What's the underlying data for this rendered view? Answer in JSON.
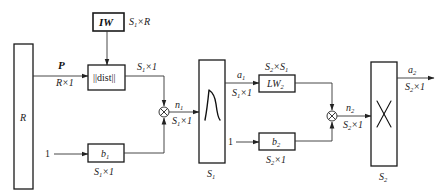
{
  "diagram": {
    "type": "block-diagram",
    "input_block": {
      "label": "R"
    },
    "input_signal": {
      "name": "P",
      "dims": "R×1"
    },
    "weight_block_1": {
      "label": "IW",
      "dims": "S1×R",
      "dims_main": "S",
      "dims_sub": "1",
      "dims_tail": "×R"
    },
    "dist_block": {
      "label": "||dist||",
      "out_dims_main": "S",
      "out_dims_sub": "1",
      "out_dims_tail": "×1"
    },
    "bias_1": {
      "input": "1",
      "label_main": "b",
      "label_sub": "1",
      "dims_main": "S",
      "dims_sub": "1",
      "dims_tail": "×1"
    },
    "sum_1": {
      "symbol": "⊗",
      "out_main": "n",
      "out_sub": "1",
      "out_dims_main": "S",
      "out_dims_sub": "1",
      "out_dims_tail": "×1"
    },
    "transfer_1": {
      "glyph": "radial-basis-curve",
      "label_main": "S",
      "label_sub": "1"
    },
    "layer1_output": {
      "main": "a",
      "sub": "1",
      "dims_main": "S",
      "dims_sub": "1",
      "dims_tail": "×1"
    },
    "weight_block_2": {
      "label_main": "LW",
      "label_sub": "2",
      "dims_a": "S",
      "dims_a_sub": "2",
      "dims_mid": "×S",
      "dims_b_sub": "1"
    },
    "bias_2": {
      "input": "1",
      "label_main": "b",
      "label_sub": "2",
      "dims_main": "S",
      "dims_sub": "2",
      "dims_tail": "×1"
    },
    "sum_2": {
      "symbol": "⊗",
      "out_main": "n",
      "out_sub": "2",
      "out_dims_main": "S",
      "out_dims_sub": "2",
      "out_dims_tail": "×1"
    },
    "transfer_2": {
      "glyph": "cross-linear",
      "label_main": "S",
      "label_sub": "2"
    },
    "layer2_output": {
      "main": "a",
      "sub": "2",
      "dims_main": "S",
      "dims_sub": "2",
      "dims_tail": "×1"
    }
  }
}
